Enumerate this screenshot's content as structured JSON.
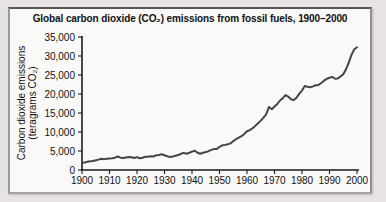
{
  "chart_data": {
    "type": "line",
    "title": "Global carbon dioxide (CO₂) emissions from fossil fuels, 1900–2000",
    "ylabel_line1": "Carbon dioxide emissions",
    "ylabel_line2": "(teragrams CO₂)",
    "xlabel": "",
    "xlim": [
      1900,
      2000
    ],
    "ylim": [
      0,
      35000
    ],
    "grid": false,
    "legend": "none",
    "xtick_values": [
      1900,
      1910,
      1920,
      1930,
      1940,
      1950,
      1960,
      1970,
      1980,
      1990,
      2000
    ],
    "xtick_labels": [
      "1900",
      "1910",
      "1920",
      "1930",
      "1940",
      "1950",
      "1960",
      "1970",
      "1980",
      "1990",
      "2000"
    ],
    "ytick_values": [
      0,
      5000,
      10000,
      15000,
      20000,
      25000,
      30000,
      35000
    ],
    "ytick_labels": [
      "0",
      "5,000",
      "10,000",
      "15,000",
      "20,000",
      "25,000",
      "30,000",
      "35,000"
    ],
    "colors": {
      "line": "#454545",
      "axis": "#1a1a1a",
      "text": "#111111",
      "panel_bg": "#faf9f7",
      "outer_bg": "#e7e3e4"
    },
    "series": [
      {
        "x": [
          1900,
          1901,
          1902,
          1903,
          1904,
          1905,
          1906,
          1907,
          1908,
          1909,
          1910,
          1911,
          1912,
          1913,
          1914,
          1915,
          1916,
          1917,
          1918,
          1919,
          1920,
          1921,
          1922,
          1923,
          1924,
          1925,
          1926,
          1927,
          1928,
          1929,
          1930,
          1931,
          1932,
          1933,
          1934,
          1935,
          1936,
          1937,
          1938,
          1939,
          1940,
          1941,
          1942,
          1943,
          1944,
          1945,
          1946,
          1947,
          1948,
          1949,
          1950,
          1951,
          1952,
          1953,
          1954,
          1955,
          1956,
          1957,
          1958,
          1959,
          1960,
          1961,
          1962,
          1963,
          1964,
          1965,
          1966,
          1967,
          1968,
          1969,
          1970,
          1971,
          1972,
          1973,
          1974,
          1975,
          1976,
          1977,
          1978,
          1979,
          1980,
          1981,
          1982,
          1983,
          1984,
          1985,
          1986,
          1987,
          1988,
          1989,
          1990,
          1991,
          1992,
          1993,
          1994,
          1995,
          1996,
          1997,
          1998,
          1999,
          2000
        ],
        "y": [
          1900,
          2000,
          2150,
          2300,
          2400,
          2550,
          2750,
          2950,
          2850,
          2950,
          3050,
          3100,
          3250,
          3550,
          3250,
          3150,
          3300,
          3400,
          3350,
          3150,
          3400,
          3100,
          3250,
          3500,
          3500,
          3600,
          3550,
          3900,
          3950,
          4150,
          3900,
          3600,
          3450,
          3550,
          3750,
          3950,
          4250,
          4500,
          4300,
          4550,
          4850,
          5050,
          4550,
          4300,
          4550,
          4700,
          4950,
          5300,
          5500,
          5500,
          6100,
          6500,
          6600,
          6800,
          7000,
          7600,
          8100,
          8500,
          8900,
          9500,
          10200,
          10500,
          11000,
          11600,
          12300,
          13000,
          13800,
          14700,
          16600,
          16000,
          16700,
          17400,
          18300,
          18900,
          19700,
          19300,
          18600,
          18400,
          19000,
          20100,
          20900,
          22100,
          21900,
          21800,
          22000,
          22300,
          22400,
          22900,
          23500,
          24000,
          24300,
          24500,
          24000,
          24100,
          24600,
          25200,
          26500,
          28300,
          30300,
          31800,
          32300
        ]
      }
    ]
  }
}
